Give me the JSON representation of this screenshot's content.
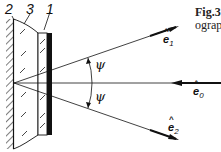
{
  "figure": {
    "caption_line1": "Fig.3",
    "caption_line2": "ograp"
  },
  "labels": {
    "part_1": "1",
    "part_2": "2",
    "part_3": "3",
    "angle_upper": "ψ",
    "angle_lower": "ψ"
  },
  "vectors": {
    "e1": {
      "base": "e",
      "sub": "1",
      "hat": "^"
    },
    "e0": {
      "base": "e",
      "sub": "0",
      "hat": "^"
    },
    "e2": {
      "base": "e",
      "sub": "2",
      "hat": "^"
    }
  },
  "colors": {
    "ink": "#111111",
    "background": "#ffffff"
  }
}
